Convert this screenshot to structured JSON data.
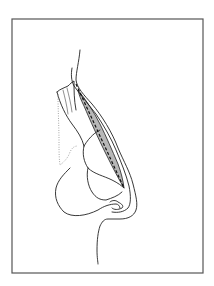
{
  "figure": {
    "type": "anatomical-line-drawing",
    "colors": {
      "background": "#ffffff",
      "frame": "#555555",
      "ink": "#222222",
      "graft_fill": "#b8b8b8"
    },
    "frame": {
      "x": 12,
      "y": 19,
      "width": 191,
      "height": 254
    },
    "paths": {
      "skin_profile_outer": "M80,50 C79,62 76,72 76,80 C77,88 84,95 92,104 C102,116 112,132 118,148 C124,162 130,172 133,184 C136,196 138,204 136,210 C134,216 128,219 120,219 L108,219 C104,219 102,222 100,226 C98,232 97,240 97,250 C97,258 98,262 98,264",
      "skin_profile_inner": "M72,68 C71,74 71,80 74,86 C80,94 88,104 96,114 C104,126 111,138 116,150 C121,162 126,174 129,186 C131,196 131,204 128,208 C124,212 118,213 112,212",
      "nasal_bone": "M57,92 C60,89 64,88 68,86 C70,84 72,82 74,81 C74,90 74,100 76,110",
      "nasal_bone_hatch": "M63,90 C65,98 67,106 68,114 M67,88 C69,96 71,104 72,112",
      "upper_lateral": "M57,92 C60,104 66,116 72,124 C78,132 82,138 84,146",
      "septal_line": "M84,146 C90,136 96,132 100,130",
      "lower_lateral_cartilage": "M84,146 C82,154 84,162 88,168 C94,174 104,176 112,180 C118,183 122,186 124,188",
      "alar_cartilage": "M88,168 C86,176 88,186 92,192 C96,198 100,200 106,200 C112,198 118,196 122,192",
      "alar_lobule": "M70,168 C64,174 58,180 56,188 C54,198 58,206 64,212 C72,218 86,216 98,210 C104,206 110,204 116,204 C118,204 120,206 120,208",
      "nostril": "M110,202 C112,200 116,200 118,202 C122,204 124,206 122,208 C118,210 114,210 112,208",
      "dotted_profile": "M58,94 C58,110 59,126 59,142 C59,150 59,158 60,165 C64,162 68,158 70,152 C72,148 74,146 78,146"
    },
    "dashed_line": {
      "x1": 76,
      "y1": 84,
      "x2": 124,
      "y2": 188
    },
    "graft": "M78,90 C86,100 94,112 100,124 C106,136 112,150 118,164 C121,172 123,180 124,188 C118,178 112,166 106,154 C98,138 90,120 84,106 C81,100 79,95 78,90 Z"
  }
}
